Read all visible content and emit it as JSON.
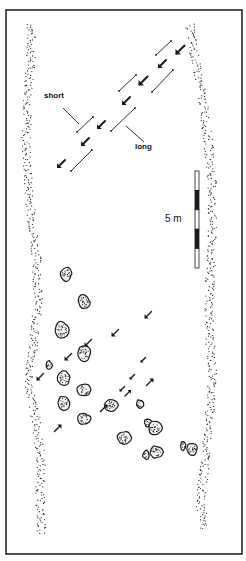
{
  "figure": {
    "frame": {
      "x": 6,
      "y": 10,
      "w": 236,
      "h": 544,
      "stroke": "#1a1a1a"
    },
    "labels": {
      "short": "short",
      "long": "long",
      "scale": "5 m"
    },
    "scale_bar": {
      "x": 195,
      "y": 171,
      "w": 4,
      "h": 97,
      "segments": [
        "white",
        "black",
        "white",
        "black",
        "white"
      ]
    },
    "upper_arrows": [
      {
        "x": 180,
        "y": 50,
        "dir": "sw",
        "size": 9
      },
      {
        "x": 162,
        "y": 64,
        "dir": "sw",
        "size": 8
      },
      {
        "x": 143,
        "y": 81,
        "dir": "sw",
        "size": 9
      },
      {
        "x": 126,
        "y": 101,
        "dir": "sw",
        "size": 8
      },
      {
        "x": 101,
        "y": 125,
        "dir": "sw",
        "size": 8
      },
      {
        "x": 85,
        "y": 142,
        "dir": "sw",
        "size": 8
      },
      {
        "x": 61,
        "y": 164,
        "dir": "sw",
        "size": 8
      }
    ],
    "brackets": [
      {
        "x1": 156,
        "y1": 55,
        "x2": 171,
        "y2": 41,
        "type": "short"
      },
      {
        "x1": 152,
        "y1": 92,
        "x2": 173,
        "y2": 70,
        "type": "long"
      },
      {
        "x1": 119,
        "y1": 91,
        "x2": 136,
        "y2": 75,
        "type": "short"
      },
      {
        "x1": 111,
        "y1": 131,
        "x2": 135,
        "y2": 108,
        "type": "long"
      },
      {
        "x1": 77,
        "y1": 132,
        "x2": 93,
        "y2": 117,
        "type": "short"
      },
      {
        "x1": 71,
        "y1": 171,
        "x2": 92,
        "y2": 150,
        "type": "long"
      }
    ],
    "leader_lines": [
      {
        "x1": 63,
        "y1": 108,
        "x2": 79,
        "y2": 124,
        "label": "short"
      },
      {
        "x1": 126,
        "y1": 126,
        "x2": 144,
        "y2": 142,
        "label": "long"
      }
    ],
    "lower_arrows": [
      {
        "x": 148,
        "y": 315,
        "dir": "sw",
        "size": 7
      },
      {
        "x": 115,
        "y": 333,
        "dir": "sw",
        "size": 7
      },
      {
        "x": 88,
        "y": 343,
        "dir": "sw",
        "size": 7
      },
      {
        "x": 68,
        "y": 357,
        "dir": "sw",
        "size": 7
      },
      {
        "x": 40,
        "y": 377,
        "dir": "sw",
        "size": 7
      },
      {
        "x": 143,
        "y": 360,
        "dir": "sw",
        "size": 5
      },
      {
        "x": 132,
        "y": 377,
        "dir": "sw",
        "size": 5
      },
      {
        "x": 122,
        "y": 389,
        "dir": "sw",
        "size": 5
      },
      {
        "x": 150,
        "y": 382,
        "dir": "ne",
        "size": 7
      },
      {
        "x": 128,
        "y": 393,
        "dir": "ne",
        "size": 6
      },
      {
        "x": 104,
        "y": 408,
        "dir": "ne",
        "size": 7
      },
      {
        "x": 58,
        "y": 428,
        "dir": "ne",
        "size": 7
      },
      {
        "x": 88,
        "y": 345,
        "dir": "sw",
        "size": 0
      }
    ],
    "boulders": [
      {
        "x": 66,
        "y": 274,
        "w": 12,
        "h": 14
      },
      {
        "x": 84,
        "y": 302,
        "w": 13,
        "h": 15
      },
      {
        "x": 62,
        "y": 330,
        "w": 14,
        "h": 18
      },
      {
        "x": 84,
        "y": 353,
        "w": 13,
        "h": 17
      },
      {
        "x": 49,
        "y": 365,
        "w": 7,
        "h": 9
      },
      {
        "x": 64,
        "y": 378,
        "w": 13,
        "h": 15
      },
      {
        "x": 84,
        "y": 390,
        "w": 14,
        "h": 13
      },
      {
        "x": 64,
        "y": 403,
        "w": 12,
        "h": 15
      },
      {
        "x": 84,
        "y": 419,
        "w": 13,
        "h": 12
      },
      {
        "x": 111,
        "y": 405,
        "w": 14,
        "h": 13
      },
      {
        "x": 140,
        "y": 404,
        "w": 7,
        "h": 9
      },
      {
        "x": 148,
        "y": 423,
        "w": 8,
        "h": 8
      },
      {
        "x": 155,
        "y": 428,
        "w": 14,
        "h": 14
      },
      {
        "x": 124,
        "y": 438,
        "w": 14,
        "h": 13
      },
      {
        "x": 183,
        "y": 446,
        "w": 5,
        "h": 10
      },
      {
        "x": 192,
        "y": 449,
        "w": 12,
        "h": 13
      },
      {
        "x": 146,
        "y": 455,
        "w": 7,
        "h": 9
      },
      {
        "x": 156,
        "y": 452,
        "w": 14,
        "h": 13
      }
    ],
    "banks": {
      "left": [
        [
          31,
          25
        ],
        [
          31,
          60
        ],
        [
          28,
          100
        ],
        [
          26,
          140
        ],
        [
          28,
          180
        ],
        [
          32,
          220
        ],
        [
          37,
          260
        ],
        [
          38,
          300
        ],
        [
          34,
          340
        ],
        [
          28,
          380
        ],
        [
          36,
          420
        ],
        [
          41,
          460
        ],
        [
          40,
          500
        ],
        [
          42,
          535
        ]
      ],
      "right": [
        [
          190,
          25
        ],
        [
          195,
          60
        ],
        [
          203,
          100
        ],
        [
          208,
          140
        ],
        [
          212,
          180
        ],
        [
          212,
          220
        ],
        [
          211,
          260
        ],
        [
          209,
          300
        ],
        [
          210,
          340
        ],
        [
          213,
          380
        ],
        [
          209,
          420
        ],
        [
          206,
          460
        ],
        [
          200,
          500
        ],
        [
          205,
          530
        ]
      ]
    },
    "colors": {
      "ink": "#1a1a1a",
      "paper": "#ffffff"
    }
  }
}
